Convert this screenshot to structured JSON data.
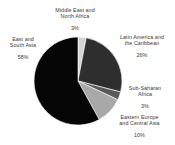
{
  "chart_data": {
    "type": "pie",
    "title": "",
    "subtitle": "",
    "xlabel": "",
    "ylabel": "",
    "legend_position": "none",
    "grid": false,
    "value_unit": "percent",
    "categories": [
      "Middle East and North Africa",
      "Latin America and the Caribbean",
      "Sub-Saharan Africa",
      "Eastern Europe and Central Asia",
      "East and South Asia"
    ],
    "values": [
      3,
      26,
      3,
      10,
      58
    ],
    "slices": [
      {
        "label": "Middle East and\nNorth Africa",
        "label_flat": "Middle East and North Africa",
        "value": 3,
        "value_text": "3%",
        "color": "#d4d4d4",
        "start_angle": 0,
        "end_angle": 10.8
      },
      {
        "label": "Latin America and\nthe Caribbean",
        "label_flat": "Latin America and the Caribbean",
        "value": 26,
        "value_text": "26%",
        "color": "#2e2e2e",
        "start_angle": 10.8,
        "end_angle": 104.4
      },
      {
        "label": "Sub-Saharan\nAfrica",
        "label_flat": "Sub-Saharan Africa",
        "value": 3,
        "value_text": "3%",
        "color": "#5a5a5a",
        "start_angle": 104.4,
        "end_angle": 115.2
      },
      {
        "label": "Eastern Europe\nand Central Asia",
        "label_flat": "Eastern Europe and Central Asia",
        "value": 10,
        "value_text": "10%",
        "color": "#a8a8a8",
        "start_angle": 115.2,
        "end_angle": 151.2
      },
      {
        "label": "East and\nSouth Asia",
        "label_flat": "East and South Asia",
        "value": 58,
        "value_text": "58%",
        "color": "#050505",
        "start_angle": 151.2,
        "end_angle": 360
      }
    ]
  },
  "labels": {
    "menap": {
      "name": "Middle East and\nNorth Africa",
      "pct": "3%"
    },
    "lac": {
      "name": "Latin America and\nthe Caribbean",
      "pct": "26%"
    },
    "ssa": {
      "name": "Sub-Saharan\nAfrica",
      "pct": "3%"
    },
    "eeca": {
      "name": "Eastern Europe\nand Central Asia",
      "pct": "10%"
    },
    "esa": {
      "name": "East and\nSouth Asia",
      "pct": "58%"
    }
  },
  "colors": {
    "background": "#ffffff",
    "text": "#3b3b3b",
    "slice_menap": "#d4d4d4",
    "slice_lac": "#2e2e2e",
    "slice_ssa": "#5a5a5a",
    "slice_eeca": "#a8a8a8",
    "slice_esa": "#050505"
  }
}
